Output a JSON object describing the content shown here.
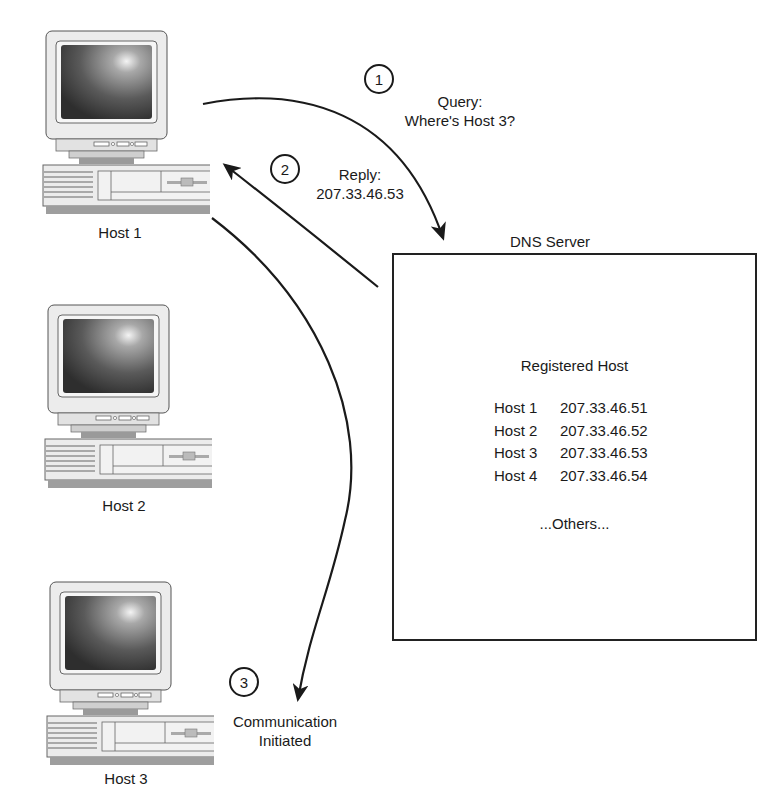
{
  "hosts": [
    {
      "label": "Host 1"
    },
    {
      "label": "Host 2"
    },
    {
      "label": "Host 3"
    }
  ],
  "server": {
    "title": "DNS Server",
    "registry_title": "Registered Host",
    "entries": [
      {
        "host": "Host 1",
        "ip": "207.33.46.51"
      },
      {
        "host": "Host 2",
        "ip": "207.33.46.52"
      },
      {
        "host": "Host 3",
        "ip": "207.33.46.53"
      },
      {
        "host": "Host 4",
        "ip": "207.33.46.54"
      }
    ],
    "others": "...Others..."
  },
  "steps": [
    {
      "number": "1",
      "line1": "Query:",
      "line2": "Where's Host 3?"
    },
    {
      "number": "2",
      "line1": "Reply:",
      "line2": "207.33.46.53"
    },
    {
      "number": "3",
      "line1": "Communication",
      "line2": "Initiated"
    }
  ],
  "colors": {
    "stroke": "#1a1a1a",
    "screen_dark": "#3a3a3a",
    "case": "#ececec"
  }
}
